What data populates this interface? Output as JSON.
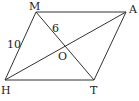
{
  "figure": {
    "type": "parallelogram with diagonals",
    "vertices": [
      {
        "name": "M",
        "x": 36,
        "y": 12
      },
      {
        "name": "A",
        "x": 126,
        "y": 12
      },
      {
        "name": "T",
        "x": 94,
        "y": 80
      },
      {
        "name": "H",
        "x": 5,
        "y": 80
      }
    ],
    "intersection": {
      "name": "O",
      "x": 64,
      "y": 47
    },
    "edges": [
      [
        "M",
        "A"
      ],
      [
        "A",
        "T"
      ],
      [
        "T",
        "H"
      ],
      [
        "H",
        "M"
      ]
    ],
    "diagonals": [
      [
        "M",
        "T"
      ],
      [
        "H",
        "A"
      ]
    ],
    "measurements": [
      {
        "segment": "MH",
        "label": "10"
      },
      {
        "segment": "MO",
        "label": "6"
      }
    ],
    "stroke_color": "#333333"
  },
  "labels": {
    "M": "M",
    "A": "A",
    "T": "T",
    "H": "H",
    "O": "O",
    "side_MH": "10",
    "seg_MO": "6"
  }
}
